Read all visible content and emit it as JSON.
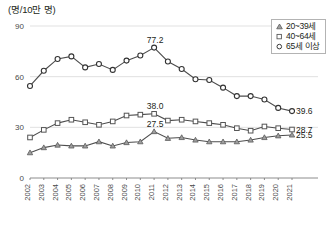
{
  "chart_data": {
    "type": "line",
    "title": "",
    "subtitle": "",
    "ylabel": "(명/10만 명)",
    "xlabel": "",
    "ylim": [
      0,
      90
    ],
    "yticks": [
      0,
      30,
      60,
      90
    ],
    "grid": true,
    "legend_position": "top-right",
    "categories": [
      "2002",
      "2003",
      "2004",
      "2005",
      "2006",
      "2007",
      "2008",
      "2009",
      "2010",
      "2011",
      "2012",
      "2013",
      "2014",
      "2015",
      "2016",
      "2017",
      "2018",
      "2019",
      "2020",
      "2021"
    ],
    "series": [
      {
        "name": "65세 이상",
        "marker": "circle",
        "values": [
          54.5,
          63.5,
          70.5,
          72.0,
          65.5,
          67.5,
          64.0,
          69.5,
          72.5,
          77.2,
          69.0,
          64.5,
          58.5,
          58.0,
          53.5,
          48.5,
          48.5,
          46.5,
          41.5,
          39.6
        ],
        "point_labels": {
          "2011": "77.2",
          "2021": "39.6"
        }
      },
      {
        "name": "40~64세",
        "marker": "square",
        "values": [
          24.0,
          28.5,
          32.5,
          34.5,
          33.0,
          31.5,
          33.5,
          37.0,
          37.5,
          38.0,
          34.0,
          34.5,
          33.5,
          32.5,
          31.5,
          29.5,
          28.0,
          30.5,
          29.5,
          28.7
        ],
        "point_labels": {
          "2011": "38.0",
          "2021": "28.7"
        }
      },
      {
        "name": "20~39세",
        "marker": "triangle",
        "values": [
          15.0,
          18.0,
          19.5,
          19.0,
          19.0,
          21.5,
          19.0,
          21.0,
          21.5,
          27.5,
          23.5,
          24.0,
          22.5,
          21.5,
          21.5,
          21.5,
          22.5,
          24.0,
          25.0,
          25.5
        ],
        "point_labels": {
          "2011": "27.5",
          "2021": "25.5"
        }
      }
    ]
  },
  "legend": {
    "items": [
      {
        "label": "20~39세",
        "marker": "triangle-marker"
      },
      {
        "label": "40~64세",
        "marker": "square-marker"
      },
      {
        "label": "65세 이상",
        "marker": "circle-marker"
      }
    ]
  },
  "axis": {
    "unit_label": "(명/10만 명)",
    "ytick_0": "0",
    "ytick_30": "30",
    "ytick_60": "60",
    "ytick_90": "90"
  },
  "annotations": {
    "peak_circle": "77.2",
    "peak_square": "38.0",
    "peak_triangle": "27.5",
    "end_circle": "39.6",
    "end_square": "28.7",
    "end_triangle": "25.5"
  }
}
